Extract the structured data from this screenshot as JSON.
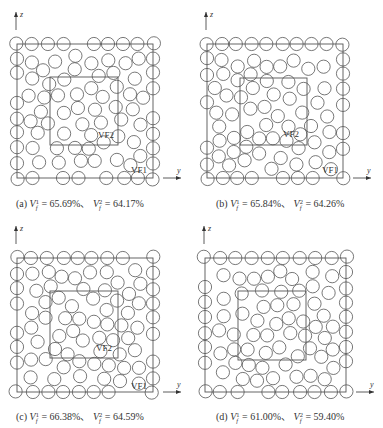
{
  "figure": {
    "panels": [
      {
        "id": "a",
        "caption": {
          "label": "(a)",
          "vf1": "65.69%",
          "vf2": "64.17%",
          "sep": "、"
        },
        "outer": [
          17,
          44,
          136,
          134
        ],
        "inner": [
          50,
          77,
          68,
          68
        ],
        "seed": 11,
        "count": 118,
        "label_vf2": {
          "text": "VF2",
          "x": 98,
          "y": 138
        },
        "label_vf1": {
          "text": "VF1",
          "x": 131,
          "y": 173
        },
        "axis_origin": [
          17,
          178
        ],
        "caption_pos": [
          16,
          205
        ]
      },
      {
        "id": "b",
        "caption": {
          "label": "(b)",
          "vf1": "65.84%",
          "vf2": "64.26%",
          "sep": "、"
        },
        "outer": [
          207,
          44,
          136,
          134
        ],
        "inner": [
          240,
          78,
          67,
          67
        ],
        "seed": 23,
        "count": 120,
        "label_vf2": {
          "text": "VF2",
          "x": 283,
          "y": 137
        },
        "label_vf1": {
          "text": "VF1",
          "x": 322,
          "y": 173
        },
        "axis_origin": [
          207,
          178
        ],
        "caption_pos": [
          216,
          205
        ]
      },
      {
        "id": "c",
        "caption": {
          "label": "(c)",
          "vf1": "66.38%",
          "vf2": "64.59%",
          "sep": "、"
        },
        "outer": [
          17,
          258,
          136,
          134
        ],
        "inner": [
          50,
          291,
          68,
          67
        ],
        "seed": 37,
        "count": 121,
        "label_vf2": {
          "text": "VF2",
          "x": 96,
          "y": 351
        },
        "label_vf1": {
          "text": "VF1",
          "x": 131,
          "y": 389
        },
        "axis_origin": [
          17,
          392
        ],
        "caption_pos": [
          16,
          418
        ]
      },
      {
        "id": "d",
        "caption": {
          "label": "(d)",
          "vf1": "61.00%",
          "vf2": "59.40%",
          "sep": "、"
        },
        "outer": [
          205,
          258,
          141,
          134
        ],
        "inner": [
          238,
          291,
          68,
          69
        ],
        "seed": 53,
        "count": 112,
        "label_vf2": {
          "text": "",
          "x": 0,
          "y": 0
        },
        "label_vf1": {
          "text": "",
          "x": 0,
          "y": 0
        },
        "axis_origin": [
          205,
          392
        ],
        "caption_pos": [
          216,
          418
        ]
      }
    ],
    "axes": {
      "horizontal": "y",
      "vertical": "z"
    },
    "symbol": {
      "base": "V",
      "sub": "f",
      "sup1": "1",
      "sup2": "2"
    },
    "style": {
      "stroke": "#555555",
      "circle_radius": 6.6
    }
  }
}
